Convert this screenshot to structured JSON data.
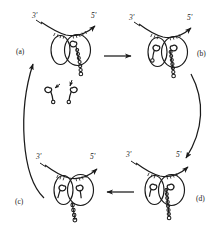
{
  "figure": {
    "type": "cyclic-process-diagram",
    "title": "",
    "background_color": "#ffffff",
    "ink_color": "#1a1a1a",
    "panel_count": 4,
    "cycle_direction": "clockwise"
  },
  "panels": [
    {
      "id": "a",
      "label": "(a)",
      "position": "top-left",
      "strand_labels": {
        "left": "3'",
        "right": "5'"
      },
      "lobes": 2,
      "bound_ribbons": 1,
      "free_ribbons": 2,
      "beaded_chain": true
    },
    {
      "id": "b",
      "label": "(b)",
      "position": "top-right",
      "strand_labels": {
        "left": "3'",
        "right": "5'"
      },
      "lobes": 2,
      "bound_ribbons": 2,
      "free_ribbons": 0,
      "beaded_chain": true
    },
    {
      "id": "d",
      "label": "(d)",
      "position": "bottom-right",
      "strand_labels": {
        "left": "3'",
        "right": "5'"
      },
      "lobes": 2,
      "bound_ribbons": 2,
      "free_ribbons": 0,
      "beaded_chain": true
    },
    {
      "id": "c",
      "label": "(c)",
      "position": "bottom-left",
      "strand_labels": {
        "left": "3'",
        "right": "5'"
      },
      "lobes": 2,
      "bound_ribbons": 2,
      "free_ribbons": 0,
      "beaded_chain": true
    }
  ],
  "arrows": [
    {
      "name": "arrow-a-to-b",
      "style": "straight",
      "direction": "right",
      "from": "a",
      "to": "b"
    },
    {
      "name": "arrow-b-to-d",
      "style": "curved",
      "direction": "down",
      "from": "b",
      "to": "d"
    },
    {
      "name": "arrow-d-to-c",
      "style": "straight",
      "direction": "left",
      "from": "d",
      "to": "c"
    },
    {
      "name": "arrow-c-to-a",
      "style": "curved",
      "direction": "up",
      "from": "c",
      "to": "a"
    }
  ],
  "annotations": {
    "entry_arrow_left": "",
    "entry_arrow_right": ""
  }
}
